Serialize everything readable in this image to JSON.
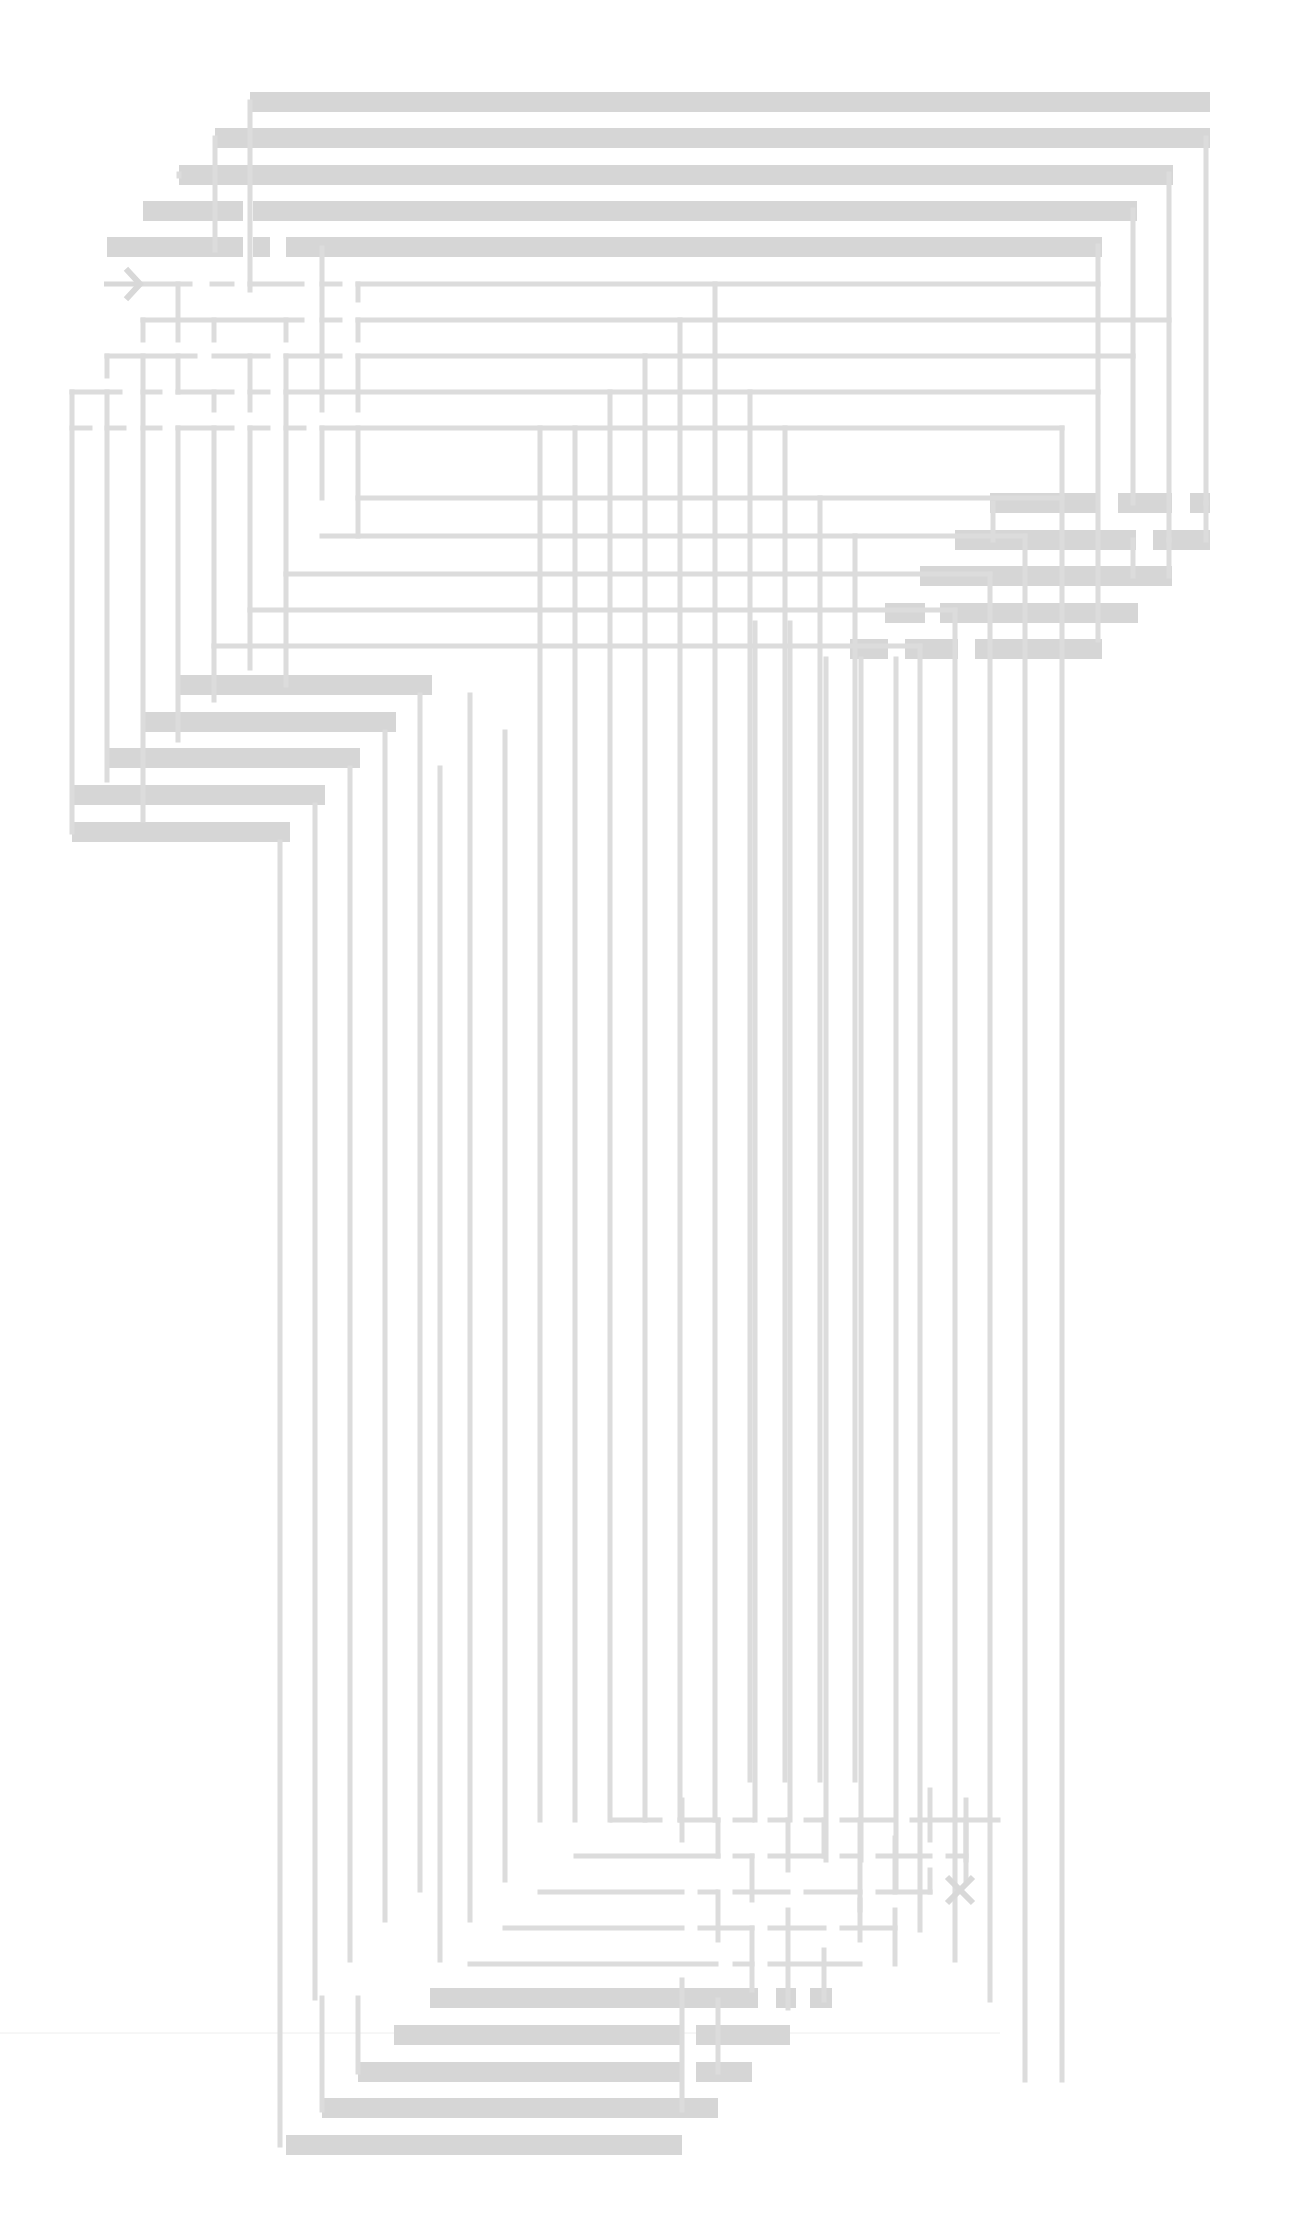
{
  "diagram": {
    "title": "Maze",
    "type": "maze",
    "background": "#ffffff",
    "colors": {
      "thin_wall": "#dcdcdc",
      "thick_wall": "#d6d6d6",
      "marker": "#d8d8d8"
    },
    "start": {
      "label": "start-arrow",
      "x1": 104,
      "y1": 284,
      "x2": 140,
      "y2": 284
    },
    "end": {
      "label": "end-x",
      "cx": 960,
      "cy": 1890,
      "size": 13
    },
    "grid": {
      "origin_x": 72,
      "origin_y": 104,
      "step_x": 35.7,
      "step_y": 36
    },
    "thick_bars": [
      [
        250,
        92,
        1210,
        112
      ],
      [
        215,
        128,
        1210,
        148
      ],
      [
        179,
        165,
        1173,
        185
      ],
      [
        143,
        201,
        243,
        221
      ],
      [
        253,
        201,
        1137,
        221
      ],
      [
        107,
        237,
        243,
        257
      ],
      [
        253,
        237,
        270,
        257
      ],
      [
        286,
        237,
        1102,
        257
      ],
      [
        990,
        493,
        1100,
        513
      ],
      [
        1118,
        493,
        1172,
        513
      ],
      [
        1190,
        493,
        1210,
        513
      ],
      [
        955,
        530,
        1136,
        550
      ],
      [
        1153,
        530,
        1210,
        550
      ],
      [
        920,
        566,
        1172,
        586
      ],
      [
        885,
        603,
        925,
        623
      ],
      [
        940,
        603,
        1138,
        623
      ],
      [
        850,
        639,
        888,
        659
      ],
      [
        905,
        639,
        958,
        659
      ],
      [
        975,
        639,
        1102,
        659
      ],
      [
        177,
        675,
        432,
        695
      ],
      [
        142,
        712,
        396,
        732
      ],
      [
        107,
        748,
        360,
        768
      ],
      [
        72,
        785,
        325,
        805
      ],
      [
        72,
        822,
        290,
        842
      ],
      [
        430,
        1988,
        758,
        2008
      ],
      [
        776,
        1988,
        796,
        2008
      ],
      [
        810,
        1988,
        832,
        2008
      ],
      [
        394,
        2025,
        682,
        2045
      ],
      [
        696,
        2025,
        790,
        2045
      ],
      [
        358,
        2062,
        682,
        2082
      ],
      [
        696,
        2062,
        752,
        2082
      ],
      [
        322,
        2098,
        718,
        2118
      ],
      [
        286,
        2135,
        682,
        2155
      ]
    ],
    "thin_lines": [
      [
        250,
        102,
        250,
        290
      ],
      [
        215,
        138,
        215,
        250
      ],
      [
        179,
        174,
        179,
        176
      ],
      [
        1206,
        138,
        1206,
        503
      ],
      [
        1169,
        174,
        1169,
        540
      ],
      [
        1133,
        210,
        1133,
        503
      ],
      [
        1098,
        246,
        1098,
        640
      ],
      [
        1206,
        540,
        1206,
        503
      ],
      [
        1133,
        540,
        1133,
        576
      ],
      [
        1169,
        576,
        1169,
        540
      ],
      [
        993,
        503,
        993,
        540
      ],
      [
        140,
        284,
        190,
        284
      ],
      [
        212,
        284,
        232,
        284
      ],
      [
        250,
        284,
        302,
        284
      ],
      [
        322,
        284,
        340,
        284
      ],
      [
        358,
        284,
        1098,
        284
      ],
      [
        178,
        284,
        178,
        340
      ],
      [
        358,
        284,
        358,
        300
      ],
      [
        322,
        248,
        322,
        392
      ],
      [
        143,
        320,
        302,
        320
      ],
      [
        322,
        320,
        340,
        320
      ],
      [
        358,
        320,
        1169,
        320
      ],
      [
        143,
        320,
        143,
        340
      ],
      [
        214,
        320,
        214,
        340
      ],
      [
        286,
        320,
        286,
        340
      ],
      [
        358,
        320,
        358,
        340
      ],
      [
        107,
        356,
        195,
        356
      ],
      [
        214,
        356,
        268,
        356
      ],
      [
        286,
        356,
        340,
        356
      ],
      [
        358,
        356,
        1133,
        356
      ],
      [
        107,
        356,
        107,
        376
      ],
      [
        143,
        356,
        143,
        820
      ],
      [
        178,
        356,
        178,
        392
      ],
      [
        250,
        356,
        250,
        410
      ],
      [
        286,
        356,
        286,
        685
      ],
      [
        358,
        356,
        358,
        410
      ],
      [
        72,
        392,
        120,
        392
      ],
      [
        143,
        392,
        160,
        392
      ],
      [
        178,
        392,
        232,
        392
      ],
      [
        250,
        392,
        268,
        392
      ],
      [
        286,
        392,
        1098,
        392
      ],
      [
        72,
        392,
        72,
        832
      ],
      [
        107,
        392,
        107,
        780
      ],
      [
        214,
        392,
        214,
        410
      ],
      [
        322,
        392,
        322,
        410
      ],
      [
        72,
        428,
        90,
        428
      ],
      [
        107,
        428,
        124,
        428
      ],
      [
        143,
        428,
        160,
        428
      ],
      [
        178,
        428,
        232,
        428
      ],
      [
        250,
        428,
        268,
        428
      ],
      [
        286,
        428,
        304,
        428
      ],
      [
        322,
        428,
        1062,
        428
      ],
      [
        178,
        428,
        178,
        740
      ],
      [
        214,
        428,
        214,
        700
      ],
      [
        250,
        428,
        250,
        668
      ],
      [
        322,
        428,
        322,
        498
      ],
      [
        358,
        428,
        358,
        536
      ],
      [
        358,
        498,
        1062,
        498
      ],
      [
        1062,
        428,
        1062,
        2080
      ],
      [
        322,
        536,
        1025,
        536
      ],
      [
        1025,
        536,
        1025,
        2080
      ],
      [
        286,
        574,
        990,
        574
      ],
      [
        990,
        574,
        990,
        2000
      ],
      [
        250,
        610,
        955,
        610
      ],
      [
        955,
        610,
        955,
        1960
      ],
      [
        214,
        646,
        920,
        646
      ],
      [
        920,
        646,
        920,
        1930
      ],
      [
        896,
        659,
        896,
        1890
      ],
      [
        861,
        659,
        861,
        1860
      ],
      [
        826,
        659,
        826,
        1860
      ],
      [
        790,
        623,
        790,
        1820
      ],
      [
        755,
        623,
        755,
        1820
      ],
      [
        420,
        695,
        420,
        1890
      ],
      [
        385,
        732,
        385,
        1920
      ],
      [
        350,
        768,
        350,
        1960
      ],
      [
        315,
        805,
        315,
        1998
      ],
      [
        280,
        842,
        280,
        2145
      ],
      [
        322,
        1998,
        322,
        2110
      ],
      [
        358,
        1998,
        358,
        2072
      ],
      [
        540,
        428,
        540,
        1820
      ],
      [
        575,
        428,
        575,
        1820
      ],
      [
        610,
        392,
        610,
        1820
      ],
      [
        645,
        356,
        645,
        1820
      ],
      [
        680,
        320,
        680,
        1820
      ],
      [
        715,
        284,
        715,
        1820
      ],
      [
        750,
        392,
        750,
        1780
      ],
      [
        785,
        428,
        785,
        1780
      ],
      [
        820,
        498,
        820,
        1780
      ],
      [
        855,
        536,
        855,
        1780
      ],
      [
        470,
        695,
        470,
        1920
      ],
      [
        505,
        732,
        505,
        1880
      ],
      [
        440,
        768,
        440,
        1960
      ],
      [
        612,
        1820,
        660,
        1820
      ],
      [
        680,
        1820,
        718,
        1820
      ],
      [
        735,
        1820,
        752,
        1820
      ],
      [
        770,
        1820,
        788,
        1820
      ],
      [
        806,
        1820,
        824,
        1820
      ],
      [
        842,
        1820,
        894,
        1820
      ],
      [
        912,
        1820,
        998,
        1820
      ],
      [
        576,
        1856,
        718,
        1856
      ],
      [
        735,
        1856,
        752,
        1856
      ],
      [
        770,
        1856,
        824,
        1856
      ],
      [
        842,
        1856,
        860,
        1856
      ],
      [
        878,
        1856,
        930,
        1856
      ],
      [
        948,
        1856,
        966,
        1856
      ],
      [
        540,
        1892,
        682,
        1892
      ],
      [
        700,
        1892,
        716,
        1892
      ],
      [
        735,
        1892,
        788,
        1892
      ],
      [
        806,
        1892,
        860,
        1892
      ],
      [
        878,
        1892,
        930,
        1892
      ],
      [
        505,
        1928,
        682,
        1928
      ],
      [
        700,
        1928,
        752,
        1928
      ],
      [
        770,
        1928,
        824,
        1928
      ],
      [
        842,
        1928,
        895,
        1928
      ],
      [
        470,
        1964,
        716,
        1964
      ],
      [
        735,
        1964,
        752,
        1964
      ],
      [
        770,
        1964,
        860,
        1964
      ],
      [
        682,
        1800,
        682,
        1840
      ],
      [
        718,
        1820,
        718,
        1856
      ],
      [
        752,
        1856,
        752,
        1900
      ],
      [
        788,
        1820,
        788,
        1870
      ],
      [
        824,
        1820,
        824,
        1856
      ],
      [
        860,
        1820,
        860,
        1910
      ],
      [
        895,
        1838,
        895,
        1892
      ],
      [
        930,
        1790,
        930,
        1840
      ],
      [
        930,
        1870,
        930,
        1892
      ],
      [
        966,
        1800,
        966,
        1860
      ],
      [
        966,
        1820,
        966,
        1880
      ],
      [
        718,
        1892,
        718,
        1940
      ],
      [
        752,
        1928,
        752,
        1990
      ],
      [
        788,
        1910,
        788,
        2008
      ],
      [
        824,
        1950,
        824,
        2000
      ],
      [
        682,
        1980,
        682,
        2110
      ],
      [
        718,
        2000,
        718,
        2072
      ],
      [
        860,
        1900,
        860,
        1940
      ],
      [
        895,
        1910,
        895,
        1964
      ]
    ],
    "annotation_line": {
      "x1": 0,
      "y1": 2033,
      "x2": 1000,
      "y2": 2033,
      "color": "#eeeeee"
    }
  }
}
